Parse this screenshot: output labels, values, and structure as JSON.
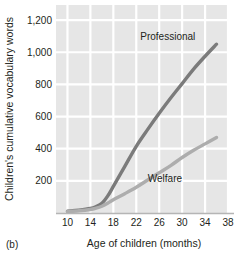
{
  "chart_data": {
    "type": "line",
    "title": "",
    "panel_label": "(b)",
    "xlabel": "Age of children (months)",
    "ylabel": "Children's cumulative vocabulary words",
    "xlim": [
      8,
      38
    ],
    "ylim": [
      0,
      1300
    ],
    "xticks": [
      10,
      14,
      18,
      22,
      26,
      30,
      34,
      38
    ],
    "xtick_labels": [
      "10",
      "14",
      "18",
      "22",
      "26",
      "30",
      "34",
      "38"
    ],
    "yticks": [
      200,
      400,
      600,
      800,
      1000,
      1200
    ],
    "ytick_labels": [
      "200",
      "400",
      "600",
      "800",
      "1,000",
      "1,200"
    ],
    "grid": true,
    "grid_color": "#ffffff",
    "plot_background": "#e6e6e6",
    "axis_color": "#b5b5b5",
    "legend_position": "inline-annotations",
    "series": [
      {
        "name": "Professional",
        "color": "#7b7b7b",
        "label_x": 27.5,
        "label_y": 1075,
        "x": [
          10,
          12,
          14,
          15,
          16,
          17,
          18,
          20,
          22,
          24,
          26,
          28,
          30,
          32,
          34,
          36
        ],
        "values": [
          12,
          18,
          28,
          40,
          60,
          105,
          165,
          290,
          415,
          520,
          620,
          715,
          805,
          895,
          975,
          1050
        ]
      },
      {
        "name": "Welfare",
        "color": "#adadad",
        "label_x": 27.0,
        "label_y": 195,
        "x": [
          10,
          12,
          14,
          15,
          16,
          17,
          18,
          20,
          22,
          24,
          26,
          28,
          30,
          32,
          34,
          36
        ],
        "values": [
          10,
          14,
          22,
          30,
          42,
          60,
          82,
          120,
          160,
          205,
          250,
          295,
          345,
          390,
          430,
          470
        ]
      }
    ]
  }
}
